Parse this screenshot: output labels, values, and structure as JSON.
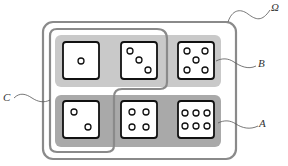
{
  "diagram": {
    "labels": {
      "omega": "Ω",
      "A": "A",
      "B": "B",
      "C": "C"
    },
    "colors": {
      "outline": "#8a8a8a",
      "event_b_fill": "#c9c9c9",
      "event_a_fill": "#a9a9a9",
      "die_border": "#111111",
      "die_face": "#ffffff",
      "pip": "#111111"
    },
    "sets": {
      "omega": "all six faces",
      "B": "top row: 1, 3, 5 (odd)",
      "A": "bottom row: 2, 4, 6 (even)",
      "C": "faces 1, 2, 3"
    },
    "dice": [
      {
        "face": 1,
        "row": "top",
        "col": 0
      },
      {
        "face": 3,
        "row": "top",
        "col": 1
      },
      {
        "face": 5,
        "row": "top",
        "col": 2
      },
      {
        "face": 2,
        "row": "bottom",
        "col": 0
      },
      {
        "face": 4,
        "row": "bottom",
        "col": 1
      },
      {
        "face": 6,
        "row": "bottom",
        "col": 2
      }
    ]
  }
}
